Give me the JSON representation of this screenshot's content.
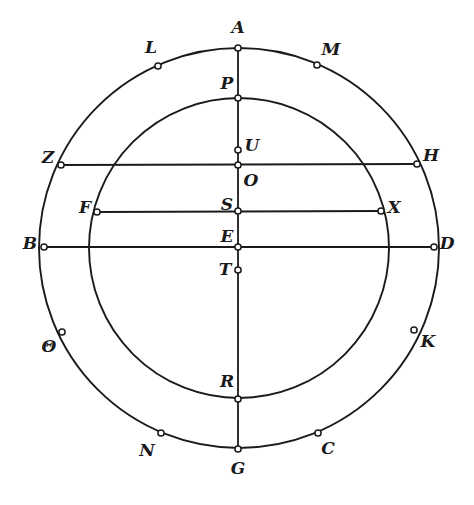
{
  "figure": {
    "type": "geometric-diagram",
    "canvas": {
      "width": 474,
      "height": 505
    },
    "stroke_color": "#1a1a1a",
    "marker_fill": "#ffffff",
    "background": "#ffffff"
  },
  "circles": [
    {
      "name": "outer-circle",
      "cx": 239,
      "cy": 248,
      "r": 200
    },
    {
      "name": "inner-circle",
      "cx": 239,
      "cy": 248,
      "r": 150
    }
  ],
  "lines": [
    {
      "name": "vertical-diameter-AG",
      "x1": 238,
      "y1": 48,
      "x2": 238,
      "y2": 449
    },
    {
      "name": "chord-ZH",
      "x1": 61,
      "y1": 165,
      "x2": 417,
      "y2": 164
    },
    {
      "name": "chord-FX",
      "x1": 97,
      "y1": 212,
      "x2": 381,
      "y2": 211
    },
    {
      "name": "diameter-BD",
      "x1": 44,
      "y1": 247,
      "x2": 434,
      "y2": 247
    }
  ],
  "points": [
    {
      "id": "A",
      "label": "A",
      "mx": 238,
      "my": 48,
      "lx": 238,
      "ly": 27,
      "on": "outer-circle"
    },
    {
      "id": "L",
      "label": "L",
      "mx": 158,
      "my": 66,
      "lx": 151,
      "ly": 47,
      "on": "outer-circle"
    },
    {
      "id": "M",
      "label": "M",
      "mx": 317,
      "my": 65,
      "lx": 331,
      "ly": 49,
      "on": "outer-circle"
    },
    {
      "id": "P",
      "label": "P",
      "mx": 238,
      "my": 98,
      "lx": 227,
      "ly": 83,
      "on": "inner-circle"
    },
    {
      "id": "U",
      "label": "U",
      "mx": 238,
      "my": 150,
      "lx": 252,
      "ly": 145,
      "on": "vertical-diameter-AG"
    },
    {
      "id": "Z",
      "label": "Z",
      "mx": 61,
      "my": 165,
      "lx": 48,
      "ly": 157,
      "on": "outer-circle"
    },
    {
      "id": "H",
      "label": "H",
      "mx": 417,
      "my": 164,
      "lx": 431,
      "ly": 155,
      "on": "outer-circle"
    },
    {
      "id": "O",
      "label": "O",
      "mx": 238,
      "my": 165,
      "lx": 251,
      "ly": 180,
      "on": "center"
    },
    {
      "id": "F",
      "label": "F",
      "mx": 97,
      "my": 212,
      "lx": 85,
      "ly": 207,
      "on": "inner-circle"
    },
    {
      "id": "S",
      "label": "S",
      "mx": 238,
      "my": 211,
      "lx": 227,
      "ly": 204,
      "on": "vertical-diameter-AG"
    },
    {
      "id": "X",
      "label": "X",
      "mx": 381,
      "my": 211,
      "lx": 394,
      "ly": 207,
      "on": "inner-circle"
    },
    {
      "id": "B",
      "label": "B",
      "mx": 44,
      "my": 247,
      "lx": 30,
      "ly": 243,
      "on": "outer-circle"
    },
    {
      "id": "E",
      "label": "E",
      "mx": 238,
      "my": 247,
      "lx": 227,
      "ly": 236,
      "on": "vertical-diameter-AG"
    },
    {
      "id": "D",
      "label": "D",
      "mx": 434,
      "my": 247,
      "lx": 447,
      "ly": 243,
      "on": "outer-circle"
    },
    {
      "id": "T",
      "label": "T",
      "mx": 238,
      "my": 270,
      "lx": 225,
      "ly": 269,
      "on": "vertical-diameter-AG"
    },
    {
      "id": "Theta",
      "label": "Θ",
      "mx": 62,
      "my": 332,
      "lx": 49,
      "ly": 346,
      "on": "outer-circle"
    },
    {
      "id": "K",
      "label": "K",
      "mx": 414,
      "my": 330,
      "lx": 428,
      "ly": 341,
      "on": "outer-circle"
    },
    {
      "id": "R",
      "label": "R",
      "mx": 238,
      "my": 399,
      "lx": 227,
      "ly": 381,
      "on": "inner-circle"
    },
    {
      "id": "N",
      "label": "N",
      "mx": 161,
      "my": 433,
      "lx": 147,
      "ly": 450,
      "on": "outer-circle"
    },
    {
      "id": "C",
      "label": "C",
      "mx": 318,
      "my": 433,
      "lx": 328,
      "ly": 448,
      "on": "outer-circle"
    },
    {
      "id": "G",
      "label": "G",
      "mx": 238,
      "my": 449,
      "lx": 238,
      "ly": 468,
      "on": "outer-circle"
    }
  ]
}
